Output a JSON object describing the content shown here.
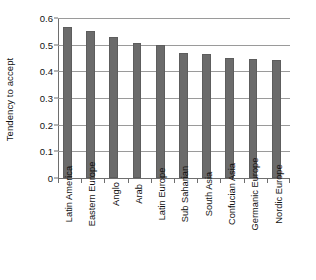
{
  "chart_data": {
    "type": "bar",
    "title": "",
    "subtitle": "",
    "xlabel": "",
    "ylabel": "Tendency to accept",
    "ylim": [
      0,
      0.6
    ],
    "yticks": [
      "0",
      "0.1",
      "0.2",
      "0.3",
      "0.4",
      "0.5",
      "0.6"
    ],
    "ytick_values": [
      0,
      0.1,
      0.2,
      0.3,
      0.4,
      0.5,
      0.6
    ],
    "grid": "horizontal",
    "legend": "none",
    "orientation": "vertical",
    "bar_color": "#6b6b6b",
    "categories": [
      "Latin America",
      "Eastern Europe",
      "Anglo",
      "Arab",
      "Latin Europe",
      "Sub Saharian",
      "South Asia",
      "Confucian Asia",
      "Germanic Europe",
      "Nordic Europe"
    ],
    "values": [
      0.565,
      0.55,
      0.53,
      0.505,
      0.5,
      0.47,
      0.465,
      0.45,
      0.445,
      0.443
    ]
  }
}
